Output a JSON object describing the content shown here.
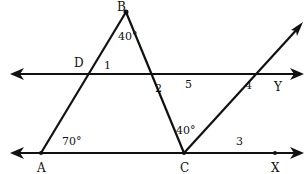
{
  "diagram": {
    "points": {
      "A": "A",
      "B": "B",
      "C": "C",
      "D": "D",
      "X": "X",
      "Y": "Y"
    },
    "angles": {
      "A": "70°",
      "B": "40°",
      "C": "40°",
      "a1": "1",
      "a2": "2",
      "a3": "3",
      "a4": "4",
      "a5": "5"
    },
    "colors": {
      "line": "#111111",
      "background": "#ffffff"
    }
  }
}
